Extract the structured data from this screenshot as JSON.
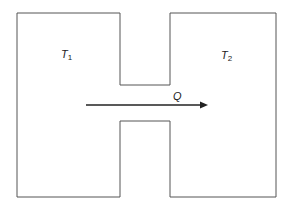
{
  "diagram": {
    "left_region": {
      "label": "T",
      "subscript": "1"
    },
    "right_region": {
      "label": "T",
      "subscript": "2"
    },
    "flow": {
      "label": "Q",
      "direction": "left-to-right"
    },
    "colors": {
      "outline": "#555555",
      "arrow": "#222222",
      "background": "#ffffff"
    }
  }
}
